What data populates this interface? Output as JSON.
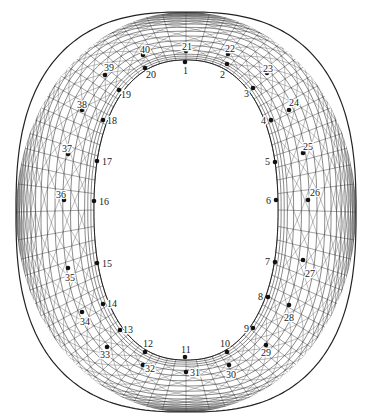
{
  "diagram": {
    "type": "structural-mesh-plan",
    "colors": {
      "mesh": "#3a3a3a",
      "background": "#ffffff",
      "point": "#111111",
      "label": "#222222"
    },
    "outer_boundary": {
      "cx": 186,
      "cy": 212,
      "rx": 170,
      "ry": 200
    },
    "inner_opening": {
      "cx": 186,
      "cy": 210,
      "rx": 92,
      "ry": 150
    },
    "inner_ring_points": [
      {
        "id": "1",
        "x": 185,
        "y": 62,
        "lx": 183,
        "ly": 74
      },
      {
        "id": "2",
        "x": 227,
        "y": 64,
        "lx": 220,
        "ly": 78
      },
      {
        "id": "3",
        "x": 253,
        "y": 88,
        "lx": 244,
        "ly": 97
      },
      {
        "id": "4",
        "x": 271,
        "y": 120,
        "lx": 261,
        "ly": 124
      },
      {
        "id": "5",
        "x": 275,
        "y": 162,
        "lx": 265,
        "ly": 165
      },
      {
        "id": "6",
        "x": 276,
        "y": 200,
        "lx": 266,
        "ly": 204
      },
      {
        "id": "7",
        "x": 275,
        "y": 262,
        "lx": 265,
        "ly": 265
      },
      {
        "id": "8",
        "x": 268,
        "y": 297,
        "lx": 258,
        "ly": 300
      },
      {
        "id": "9",
        "x": 253,
        "y": 328,
        "lx": 244,
        "ly": 332
      },
      {
        "id": "10",
        "x": 227,
        "y": 352,
        "lx": 220,
        "ly": 347
      },
      {
        "id": "11",
        "x": 185,
        "y": 357,
        "lx": 181,
        "ly": 353
      },
      {
        "id": "12",
        "x": 145,
        "y": 352,
        "lx": 143,
        "ly": 347
      },
      {
        "id": "13",
        "x": 120,
        "y": 330,
        "lx": 123,
        "ly": 333
      },
      {
        "id": "14",
        "x": 103,
        "y": 304,
        "lx": 107,
        "ly": 307
      },
      {
        "id": "15",
        "x": 97,
        "y": 263,
        "lx": 102,
        "ly": 267
      },
      {
        "id": "16",
        "x": 94,
        "y": 201,
        "lx": 99,
        "ly": 205
      },
      {
        "id": "17",
        "x": 97,
        "y": 161,
        "lx": 102,
        "ly": 165
      },
      {
        "id": "18",
        "x": 103,
        "y": 120,
        "lx": 107,
        "ly": 124
      },
      {
        "id": "19",
        "x": 119,
        "y": 90,
        "lx": 121,
        "ly": 98
      },
      {
        "id": "20",
        "x": 145,
        "y": 68,
        "lx": 146,
        "ly": 78
      }
    ],
    "outer_ring_points": [
      {
        "id": "21",
        "x": 186,
        "y": 51,
        "lx": 182,
        "ly": 50
      },
      {
        "id": "22",
        "x": 228,
        "y": 54,
        "lx": 225,
        "ly": 52
      },
      {
        "id": "23",
        "x": 267,
        "y": 73,
        "lx": 263,
        "ly": 72
      },
      {
        "id": "24",
        "x": 289,
        "y": 110,
        "lx": 289,
        "ly": 106
      },
      {
        "id": "25",
        "x": 303,
        "y": 153,
        "lx": 303,
        "ly": 150
      },
      {
        "id": "26",
        "x": 308,
        "y": 200,
        "lx": 310,
        "ly": 196
      },
      {
        "id": "27",
        "x": 303,
        "y": 260,
        "lx": 305,
        "ly": 277
      },
      {
        "id": "28",
        "x": 289,
        "y": 305,
        "lx": 284,
        "ly": 321
      },
      {
        "id": "29",
        "x": 266,
        "y": 345,
        "lx": 261,
        "ly": 356
      },
      {
        "id": "30",
        "x": 229,
        "y": 365,
        "lx": 226,
        "ly": 378
      },
      {
        "id": "31",
        "x": 186,
        "y": 372,
        "lx": 190,
        "ly": 376
      },
      {
        "id": "32",
        "x": 143,
        "y": 365,
        "lx": 145,
        "ly": 372
      },
      {
        "id": "33",
        "x": 107,
        "y": 347,
        "lx": 100,
        "ly": 358
      },
      {
        "id": "34",
        "x": 82,
        "y": 312,
        "lx": 80,
        "ly": 325
      },
      {
        "id": "35",
        "x": 68,
        "y": 268,
        "lx": 65,
        "ly": 281
      },
      {
        "id": "36",
        "x": 64,
        "y": 200,
        "lx": 56,
        "ly": 198
      },
      {
        "id": "37",
        "x": 68,
        "y": 154,
        "lx": 62,
        "ly": 152
      },
      {
        "id": "38",
        "x": 82,
        "y": 110,
        "lx": 77,
        "ly": 108
      },
      {
        "id": "39",
        "x": 105,
        "y": 75,
        "lx": 104,
        "ly": 71
      },
      {
        "id": "40",
        "x": 143,
        "y": 55,
        "lx": 140,
        "ly": 53
      }
    ]
  }
}
